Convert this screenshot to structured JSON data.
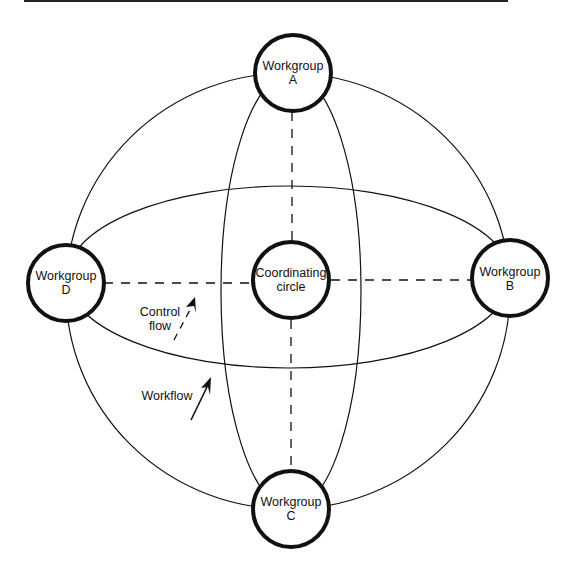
{
  "diagram": {
    "nodes": {
      "workgroup_a": {
        "line1": "Workgroup",
        "line2": "A"
      },
      "workgroup_b": {
        "line1": "Workgroup",
        "line2": "B"
      },
      "workgroup_c": {
        "line1": "Workgroup",
        "line2": "C"
      },
      "workgroup_d": {
        "line1": "Workgroup",
        "line2": "D"
      },
      "coordinating": {
        "line1": "Coordinating",
        "line2": "circle"
      }
    },
    "annotations": {
      "control_flow": {
        "line1": "Control",
        "line2": "flow"
      },
      "workflow": {
        "label": "Workflow"
      }
    },
    "edges": [
      {
        "type": "workflow",
        "style": "solid",
        "shape": "outer-ellipse",
        "connects": [
          "A",
          "B",
          "C",
          "D"
        ]
      },
      {
        "type": "workflow",
        "style": "solid",
        "shape": "horizontal-ellipse",
        "connects": [
          "D",
          "B"
        ]
      },
      {
        "type": "workflow",
        "style": "solid",
        "shape": "vertical-ellipse",
        "connects": [
          "A",
          "C"
        ]
      },
      {
        "type": "control",
        "style": "dashed",
        "from": "Coordinating circle",
        "to": "A"
      },
      {
        "type": "control",
        "style": "dashed",
        "from": "Coordinating circle",
        "to": "B"
      },
      {
        "type": "control",
        "style": "dashed",
        "from": "Coordinating circle",
        "to": "C"
      },
      {
        "type": "control",
        "style": "dashed",
        "from": "Coordinating circle",
        "to": "D"
      }
    ],
    "colors": {
      "stroke": "#111111",
      "background": "#ffffff"
    }
  }
}
